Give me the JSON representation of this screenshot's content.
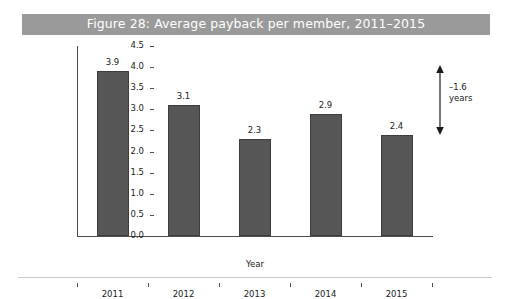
{
  "figure": {
    "title": "Figure 28: Average payback per member, 2011–2015",
    "title_bar_color": "#9a9a9a",
    "title_text_color": "#ffffff",
    "bar_color": "#565656",
    "bar_border_color": "#3d3d3d",
    "axis_color": "#4d4d4d",
    "rule_color": "#c9c9c9",
    "background_color": "#ffffff"
  },
  "annotation": {
    "line1": "–1.6",
    "line2": "years",
    "arrow_name": "double-headed-vertical-arrow"
  },
  "chart_data": {
    "type": "bar",
    "title": "Figure 28: Average payback per member, 2011–2015",
    "categories": [
      "2011",
      "2012",
      "2013",
      "2014",
      "2015"
    ],
    "values": [
      3.9,
      3.1,
      2.3,
      2.9,
      2.4
    ],
    "data_labels": [
      "3.9",
      "3.1",
      "2.3",
      "2.9",
      "2.4"
    ],
    "xlabel": "Year",
    "ylabel": "Payback (years)",
    "ylim": [
      0.0,
      4.5
    ],
    "ytick_step": 0.5,
    "ytick_labels": [
      "0.0",
      "0.5",
      "1.0",
      "1.5",
      "2.0",
      "2.5",
      "3.0",
      "3.5",
      "4.0",
      "4.5"
    ],
    "ytick_values": [
      0.0,
      0.5,
      1.0,
      1.5,
      2.0,
      2.5,
      3.0,
      3.5,
      4.0,
      4.5
    ],
    "grid": false,
    "legend": null,
    "annotations": [
      {
        "text": "–1.6 years",
        "from_value": 3.9,
        "to_value": 2.4,
        "type": "range-arrow"
      }
    ]
  }
}
